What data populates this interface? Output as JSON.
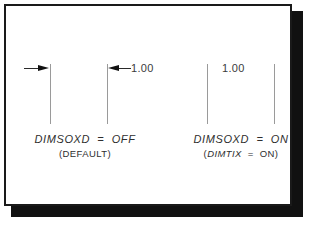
{
  "figure": {
    "kind": "cad-dimension-variable-illustration",
    "background_color": "#ffffff",
    "frame_border_color": "#1a1a1a",
    "shadow_color": "#111111",
    "extension_line_color": "#9a9a9a",
    "arrow_color": "#111111",
    "text_color": "#2e2e2e"
  },
  "examples": [
    {
      "id": "dimsoxd-off-no-text",
      "dimension_text": "",
      "arrow_direction": "right",
      "arrow_placement": "outside",
      "extension_lines": 1
    },
    {
      "id": "dimsoxd-off-with-text",
      "dimension_text": "1.00",
      "arrow_direction": "left",
      "arrow_placement": "outside",
      "extension_lines": 1
    },
    {
      "id": "dimsoxd-on",
      "dimension_text": "1.00",
      "arrow_direction": "none",
      "arrow_placement": "suppressed",
      "extension_lines": 2
    }
  ],
  "captions": {
    "left": {
      "line1": "DIMSOXD  =  OFF",
      "line2_prefix": "(DEFAULT)",
      "line2_italic": "",
      "line2_suffix": ""
    },
    "right": {
      "line1": "DIMSOXD  =  ON",
      "line2_prefix": "(",
      "line2_italic": "DIMTIX",
      "line2_suffix": "  =  ON)"
    }
  }
}
